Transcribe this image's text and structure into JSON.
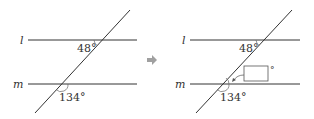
{
  "left_figure": {
    "line_l_label": "l",
    "line_m_label": "m",
    "angle_top": "48°",
    "angle_bottom": "134°"
  },
  "arrow": {
    "icon": "right-arrow-icon",
    "color": "#a0a0a0"
  },
  "right_figure": {
    "line_l_label": "l",
    "line_m_label": "m",
    "angle_top": "48°",
    "angle_bottom": "134°",
    "answer_box_value": "",
    "answer_box_unit": "°"
  }
}
